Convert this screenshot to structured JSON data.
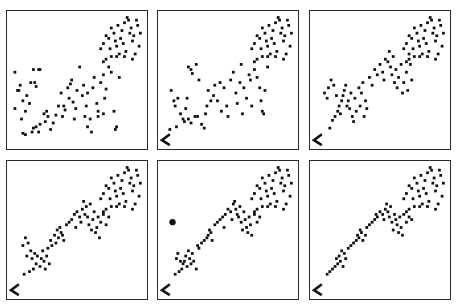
{
  "chart_data": [
    {
      "type": "scatter",
      "panel": 1,
      "title": "",
      "xlabel": "",
      "ylabel": "",
      "xlim": [
        0,
        100
      ],
      "ylim": [
        0,
        100
      ],
      "grid": false,
      "legend": null,
      "corner_marker": false,
      "points": [
        [
          3,
          28
        ],
        [
          5,
          42
        ],
        [
          7,
          46
        ],
        [
          3,
          56
        ],
        [
          9,
          34
        ],
        [
          12,
          38
        ],
        [
          6,
          42
        ],
        [
          11,
          26
        ],
        [
          14,
          32
        ],
        [
          8,
          20
        ],
        [
          15,
          48
        ],
        [
          18,
          48
        ],
        [
          19,
          45
        ],
        [
          22,
          58
        ],
        [
          17,
          58
        ],
        [
          21,
          58
        ],
        [
          9,
          9
        ],
        [
          11,
          8
        ],
        [
          17,
          13
        ],
        [
          19,
          14
        ],
        [
          16,
          10
        ],
        [
          21,
          10
        ],
        [
          26,
          18
        ],
        [
          28,
          22
        ],
        [
          25,
          24
        ],
        [
          27,
          26
        ],
        [
          22,
          16
        ],
        [
          30,
          12
        ],
        [
          32,
          17
        ],
        [
          34,
          23
        ],
        [
          36,
          30
        ],
        [
          38,
          40
        ],
        [
          39,
          22
        ],
        [
          40,
          30
        ],
        [
          41,
          27
        ],
        [
          43,
          44
        ],
        [
          44,
          36
        ],
        [
          45,
          47
        ],
        [
          46,
          50
        ],
        [
          47,
          33
        ],
        [
          48,
          20
        ],
        [
          49,
          28
        ],
        [
          50,
          42
        ],
        [
          52,
          60
        ],
        [
          54,
          38
        ],
        [
          55,
          46
        ],
        [
          56,
          22
        ],
        [
          57,
          30
        ],
        [
          58,
          40
        ],
        [
          60,
          20
        ],
        [
          62,
          44
        ],
        [
          63,
          52
        ],
        [
          65,
          32
        ],
        [
          66,
          26
        ],
        [
          68,
          48
        ],
        [
          70,
          54
        ],
        [
          71,
          36
        ],
        [
          72,
          43
        ],
        [
          74,
          60
        ],
        [
          76,
          56
        ],
        [
          78,
          26
        ],
        [
          79,
          12
        ],
        [
          80,
          14
        ],
        [
          82,
          52
        ],
        [
          58,
          14
        ],
        [
          61,
          10
        ],
        [
          66,
          22
        ],
        [
          70,
          24
        ]
      ]
    },
    {
      "type": "scatter",
      "panel": 2,
      "title": "",
      "xlabel": "",
      "ylabel": "",
      "xlim": [
        0,
        100
      ],
      "ylim": [
        0,
        100
      ],
      "grid": false,
      "legend": null,
      "corner_marker": true,
      "points": [
        [
          6,
          12
        ],
        [
          11,
          14
        ],
        [
          17,
          18
        ],
        [
          20,
          20
        ],
        [
          22,
          17
        ],
        [
          25,
          22
        ],
        [
          27,
          22
        ],
        [
          30,
          16
        ],
        [
          32,
          13
        ],
        [
          33,
          24
        ],
        [
          34,
          30
        ],
        [
          35,
          42
        ],
        [
          37,
          34
        ],
        [
          39,
          38
        ],
        [
          40,
          46
        ],
        [
          42,
          34
        ],
        [
          44,
          48
        ],
        [
          45,
          26
        ],
        [
          47,
          44
        ],
        [
          49,
          30
        ],
        [
          50,
          22
        ],
        [
          52,
          50
        ],
        [
          54,
          56
        ],
        [
          56,
          40
        ],
        [
          57,
          32
        ],
        [
          59,
          48
        ],
        [
          60,
          62
        ],
        [
          61,
          24
        ],
        [
          62,
          44
        ],
        [
          64,
          36
        ],
        [
          66,
          54
        ],
        [
          67,
          50
        ],
        [
          68,
          30
        ],
        [
          70,
          58
        ],
        [
          72,
          52
        ],
        [
          74,
          44
        ],
        [
          75,
          34
        ],
        [
          76,
          26
        ],
        [
          77,
          24
        ],
        [
          78,
          42
        ],
        [
          80,
          60
        ],
        [
          7,
          42
        ],
        [
          9,
          34
        ],
        [
          10,
          30
        ],
        [
          12,
          36
        ],
        [
          20,
          60
        ],
        [
          22,
          58
        ],
        [
          23,
          55
        ],
        [
          26,
          62
        ],
        [
          28,
          50
        ],
        [
          14,
          24
        ],
        [
          16,
          20
        ],
        [
          18,
          28
        ],
        [
          19,
          36
        ]
      ]
    },
    {
      "type": "scatter",
      "panel": 3,
      "title": "",
      "xlabel": "",
      "ylabel": "",
      "xlim": [
        0,
        100
      ],
      "ylim": [
        0,
        100
      ],
      "grid": false,
      "legend": null,
      "corner_marker": true,
      "points": [
        [
          12,
          13
        ],
        [
          14,
          19
        ],
        [
          16,
          22
        ],
        [
          18,
          26
        ],
        [
          19,
          30
        ],
        [
          20,
          24
        ],
        [
          21,
          34
        ],
        [
          22,
          38
        ],
        [
          23,
          42
        ],
        [
          24,
          46
        ],
        [
          25,
          30
        ],
        [
          26,
          34
        ],
        [
          27,
          28
        ],
        [
          28,
          40
        ],
        [
          29,
          22
        ],
        [
          30,
          18
        ],
        [
          31,
          36
        ],
        [
          32,
          26
        ],
        [
          34,
          44
        ],
        [
          35,
          30
        ],
        [
          36,
          40
        ],
        [
          37,
          48
        ],
        [
          38,
          22
        ],
        [
          39,
          34
        ],
        [
          40,
          28
        ],
        [
          42,
          52
        ],
        [
          44,
          46
        ],
        [
          46,
          58
        ],
        [
          48,
          54
        ],
        [
          50,
          62
        ],
        [
          52,
          56
        ],
        [
          53,
          50
        ],
        [
          54,
          66
        ],
        [
          56,
          64
        ],
        [
          57,
          72
        ],
        [
          58,
          60
        ],
        [
          59,
          54
        ],
        [
          60,
          68
        ],
        [
          61,
          48
        ],
        [
          62,
          58
        ],
        [
          63,
          44
        ],
        [
          64,
          52
        ],
        [
          66,
          62
        ],
        [
          67,
          40
        ],
        [
          68,
          48
        ],
        [
          70,
          56
        ],
        [
          71,
          42
        ],
        [
          72,
          70
        ],
        [
          73,
          62
        ],
        [
          74,
          50
        ],
        [
          8,
          40
        ],
        [
          10,
          36
        ],
        [
          11,
          44
        ],
        [
          13,
          50
        ],
        [
          15,
          46
        ],
        [
          17,
          38
        ]
      ]
    },
    {
      "type": "scatter",
      "panel": 4,
      "title": "",
      "xlabel": "",
      "ylabel": "",
      "xlim": [
        0,
        100
      ],
      "ylim": [
        0,
        100
      ],
      "grid": false,
      "legend": null,
      "corner_marker": true,
      "points": [
        [
          10,
          16
        ],
        [
          14,
          18
        ],
        [
          17,
          20
        ],
        [
          19,
          24
        ],
        [
          20,
          30
        ],
        [
          22,
          22
        ],
        [
          23,
          28
        ],
        [
          24,
          34
        ],
        [
          25,
          26
        ],
        [
          26,
          20
        ],
        [
          27,
          30
        ],
        [
          28,
          36
        ],
        [
          29,
          24
        ],
        [
          30,
          42
        ],
        [
          31,
          38
        ],
        [
          33,
          46
        ],
        [
          34,
          40
        ],
        [
          35,
          50
        ],
        [
          36,
          44
        ],
        [
          37,
          52
        ],
        [
          38,
          48
        ],
        [
          39,
          46
        ],
        [
          40,
          42
        ],
        [
          42,
          54
        ],
        [
          44,
          56
        ],
        [
          46,
          58
        ],
        [
          48,
          62
        ],
        [
          49,
          52
        ],
        [
          50,
          64
        ],
        [
          52,
          60
        ],
        [
          53,
          56
        ],
        [
          54,
          66
        ],
        [
          55,
          72
        ],
        [
          56,
          62
        ],
        [
          57,
          68
        ],
        [
          58,
          60
        ],
        [
          59,
          54
        ],
        [
          60,
          70
        ],
        [
          61,
          50
        ],
        [
          62,
          58
        ],
        [
          63,
          64
        ],
        [
          64,
          48
        ],
        [
          65,
          52
        ],
        [
          66,
          60
        ],
        [
          67,
          44
        ],
        [
          68,
          56
        ],
        [
          70,
          62
        ],
        [
          72,
          54
        ],
        [
          74,
          60
        ],
        [
          9,
          38
        ],
        [
          11,
          44
        ],
        [
          12,
          30
        ],
        [
          13,
          40
        ],
        [
          15,
          34
        ],
        [
          16,
          28
        ],
        [
          18,
          32
        ]
      ]
    },
    {
      "type": "scatter",
      "panel": 5,
      "title": "",
      "xlabel": "",
      "ylabel": "",
      "xlim": [
        0,
        100
      ],
      "ylim": [
        0,
        100
      ],
      "grid": false,
      "legend": null,
      "corner_marker": true,
      "outlier": [
        8,
        56
      ],
      "points": [
        [
          10,
          16
        ],
        [
          13,
          18
        ],
        [
          15,
          20
        ],
        [
          17,
          26
        ],
        [
          18,
          30
        ],
        [
          19,
          22
        ],
        [
          20,
          34
        ],
        [
          21,
          28
        ],
        [
          22,
          24
        ],
        [
          23,
          32
        ],
        [
          24,
          26
        ],
        [
          26,
          20
        ],
        [
          27,
          38
        ],
        [
          28,
          36
        ],
        [
          30,
          40
        ],
        [
          32,
          42
        ],
        [
          34,
          44
        ],
        [
          35,
          46
        ],
        [
          36,
          50
        ],
        [
          37,
          48
        ],
        [
          38,
          42
        ],
        [
          40,
          54
        ],
        [
          42,
          56
        ],
        [
          44,
          58
        ],
        [
          46,
          60
        ],
        [
          47,
          52
        ],
        [
          48,
          62
        ],
        [
          50,
          66
        ],
        [
          52,
          64
        ],
        [
          53,
          58
        ],
        [
          54,
          70
        ],
        [
          55,
          72
        ],
        [
          56,
          66
        ],
        [
          57,
          62
        ],
        [
          58,
          60
        ],
        [
          59,
          68
        ],
        [
          60,
          56
        ],
        [
          61,
          50
        ],
        [
          62,
          64
        ],
        [
          63,
          58
        ],
        [
          64,
          52
        ],
        [
          65,
          48
        ],
        [
          66,
          60
        ],
        [
          67,
          54
        ],
        [
          68,
          46
        ],
        [
          70,
          62
        ],
        [
          72,
          56
        ],
        [
          74,
          60
        ],
        [
          11,
          28
        ],
        [
          12,
          32
        ],
        [
          14,
          26
        ],
        [
          16,
          24
        ]
      ]
    },
    {
      "type": "scatter",
      "panel": 6,
      "title": "",
      "xlabel": "",
      "ylabel": "",
      "xlim": [
        0,
        100
      ],
      "ylim": [
        0,
        100
      ],
      "grid": false,
      "legend": null,
      "corner_marker": true,
      "points": [
        [
          10,
          16
        ],
        [
          12,
          18
        ],
        [
          14,
          20
        ],
        [
          16,
          22
        ],
        [
          17,
          28
        ],
        [
          18,
          24
        ],
        [
          19,
          30
        ],
        [
          20,
          26
        ],
        [
          21,
          34
        ],
        [
          22,
          22
        ],
        [
          23,
          32
        ],
        [
          24,
          28
        ],
        [
          26,
          36
        ],
        [
          28,
          38
        ],
        [
          30,
          40
        ],
        [
          32,
          42
        ],
        [
          33,
          46
        ],
        [
          34,
          44
        ],
        [
          35,
          50
        ],
        [
          36,
          48
        ],
        [
          37,
          42
        ],
        [
          39,
          46
        ],
        [
          40,
          52
        ],
        [
          42,
          54
        ],
        [
          44,
          56
        ],
        [
          46,
          58
        ],
        [
          47,
          62
        ],
        [
          48,
          60
        ],
        [
          50,
          64
        ],
        [
          52,
          62
        ],
        [
          53,
          58
        ],
        [
          54,
          66
        ],
        [
          55,
          70
        ],
        [
          56,
          64
        ],
        [
          57,
          60
        ],
        [
          58,
          68
        ],
        [
          59,
          56
        ],
        [
          60,
          50
        ],
        [
          61,
          62
        ],
        [
          62,
          58
        ],
        [
          63,
          54
        ],
        [
          64,
          48
        ],
        [
          65,
          60
        ],
        [
          66,
          52
        ],
        [
          67,
          46
        ],
        [
          68,
          62
        ],
        [
          70,
          56
        ],
        [
          72,
          60
        ],
        [
          74,
          58
        ]
      ]
    }
  ],
  "shared_upper_cluster": [
    [
      68,
      74
    ],
    [
      70,
      78
    ],
    [
      72,
      84
    ],
    [
      74,
      82
    ],
    [
      75,
      74
    ],
    [
      76,
      90
    ],
    [
      78,
      86
    ],
    [
      79,
      80
    ],
    [
      80,
      76
    ],
    [
      81,
      92
    ],
    [
      82,
      70
    ],
    [
      83,
      82
    ],
    [
      84,
      88
    ],
    [
      85,
      78
    ],
    [
      86,
      94
    ],
    [
      87,
      72
    ],
    [
      88,
      98
    ],
    [
      89,
      96
    ],
    [
      90,
      86
    ],
    [
      91,
      90
    ],
    [
      92,
      80
    ],
    [
      93,
      84
    ],
    [
      94,
      70
    ],
    [
      95,
      96
    ],
    [
      96,
      92
    ],
    [
      97,
      76
    ],
    [
      98,
      86
    ],
    [
      92,
      66
    ],
    [
      86,
      68
    ],
    [
      80,
      68
    ],
    [
      76,
      68
    ],
    [
      72,
      66
    ],
    [
      70,
      64
    ]
  ]
}
